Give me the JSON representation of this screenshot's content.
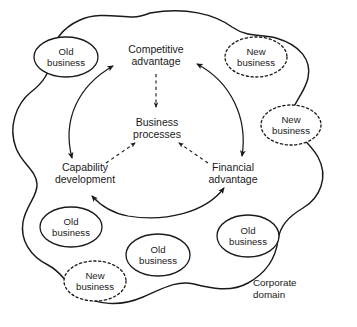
{
  "diagram": {
    "domain_label": {
      "line1": "Corporate",
      "line2": "domain"
    },
    "colors": {
      "stroke": "#1a1a1a",
      "background": "#ffffff",
      "text": "#1a1a1a"
    },
    "center_node": {
      "line1": "Business",
      "line2": "processes"
    },
    "cycle_nodes": [
      {
        "id": "competitive-advantage",
        "line1": "Competitive",
        "line2": "advantage"
      },
      {
        "id": "capability-development",
        "line1": "Capability",
        "line2": "development"
      },
      {
        "id": "financial-advantage",
        "line1": "Financial",
        "line2": "advantage"
      }
    ],
    "ellipses": [
      {
        "id": "old-business-top-left",
        "type": "old",
        "line1": "Old",
        "line2": "business",
        "border": "solid"
      },
      {
        "id": "new-business-top-right",
        "type": "new",
        "line1": "New",
        "line2": "business",
        "border": "dashed"
      },
      {
        "id": "new-business-right",
        "type": "new",
        "line1": "New",
        "line2": "business",
        "border": "dashed"
      },
      {
        "id": "old-business-bottom-left",
        "type": "old",
        "line1": "Old",
        "line2": "business",
        "border": "solid"
      },
      {
        "id": "new-business-bottom-left",
        "type": "new",
        "line1": "New",
        "line2": "business",
        "border": "dashed"
      },
      {
        "id": "old-business-bottom-center",
        "type": "old",
        "line1": "Old",
        "line2": "business",
        "border": "solid"
      },
      {
        "id": "old-business-bottom-right",
        "type": "old",
        "line1": "Old",
        "line2": "business",
        "border": "solid"
      }
    ],
    "connectors": [
      {
        "id": "capability-to-competitive",
        "style": "solid",
        "arrows": "both"
      },
      {
        "id": "competitive-to-financial",
        "style": "solid",
        "arrows": "both"
      },
      {
        "id": "financial-to-capability",
        "style": "solid",
        "arrows": "both"
      },
      {
        "id": "competitive-to-processes",
        "style": "dashed",
        "arrows": "end"
      },
      {
        "id": "capability-to-processes",
        "style": "dashed",
        "arrows": "end"
      },
      {
        "id": "financial-to-processes",
        "style": "dashed",
        "arrows": "end"
      }
    ]
  }
}
